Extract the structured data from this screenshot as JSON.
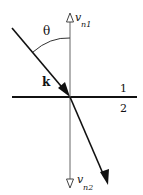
{
  "diagram": {
    "labels": {
      "theta": "θ",
      "k": "k",
      "v_n1": "v",
      "v_n1_sub": "n1",
      "v_n2": "v",
      "v_n2_sub": "n2",
      "medium_1": "1",
      "medium_2": "2"
    },
    "colors": {
      "line": "#111111",
      "axis": "#555555",
      "background": "#ffffff"
    }
  }
}
